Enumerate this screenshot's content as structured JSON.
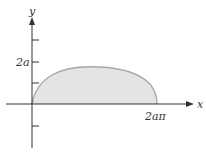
{
  "figure": {
    "axes": {
      "x_label": "x",
      "y_label": "y"
    },
    "tick_labels": {
      "y_tick": "2a",
      "x_tick": "2aπ"
    },
    "colors": {
      "fill": "#e4e4e4",
      "curve": "#a8a8a8",
      "axis": "#333333"
    },
    "curve_description": "Cycloid arch from origin to x = 2aπ with maximum height 2a, region under arch shaded"
  }
}
